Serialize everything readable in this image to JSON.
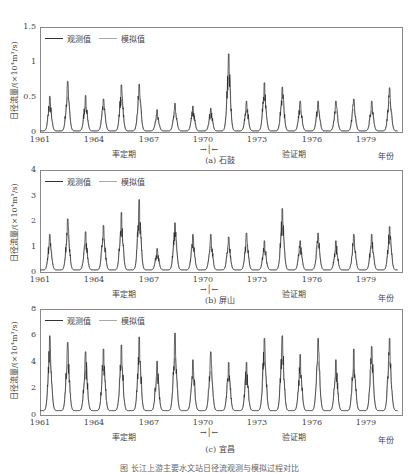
{
  "chart_data": [
    {
      "type": "line",
      "panel": "(a) 石鼓",
      "ylabel": "日径流量/(×10⁴m³/s)",
      "xlabel": "年份",
      "yticks": [
        "0",
        "0.5",
        "1",
        "1.5"
      ],
      "ylim": [
        0,
        1.5
      ],
      "xticks": [
        "1961",
        "1964",
        "1967",
        "1970",
        "1973",
        "1976",
        "1979"
      ],
      "legend": [
        "观测值",
        "模拟值"
      ],
      "annual_peaks_years": [
        1961,
        1962,
        1963,
        1964,
        1965,
        1966,
        1967,
        1968,
        1969,
        1970,
        1971,
        1972,
        1973,
        1974,
        1975,
        1976,
        1977,
        1978,
        1979,
        1980
      ],
      "annual_peaks": [
        0.52,
        0.73,
        0.53,
        0.48,
        0.68,
        0.69,
        0.33,
        0.42,
        0.38,
        0.35,
        1.12,
        0.45,
        0.71,
        0.65,
        0.45,
        0.45,
        0.45,
        0.48,
        0.45,
        0.64
      ],
      "calibration_label": "率定期",
      "validation_label": "验证期"
    },
    {
      "type": "line",
      "panel": "(b) 屏山",
      "ylabel": "日径流量/(×10⁴m³/s)",
      "xlabel": "年份",
      "yticks": [
        "0",
        "1",
        "2",
        "3",
        "4"
      ],
      "ylim": [
        0,
        4
      ],
      "xticks": [
        "1961",
        "1964",
        "1967",
        "1970",
        "1973",
        "1976",
        "1979"
      ],
      "legend": [
        "观测值",
        "模拟值"
      ],
      "annual_peaks_years": [
        1961,
        1962,
        1963,
        1964,
        1965,
        1966,
        1967,
        1968,
        1969,
        1970,
        1971,
        1972,
        1973,
        1974,
        1975,
        1976,
        1977,
        1978,
        1979,
        1980
      ],
      "annual_peaks": [
        1.5,
        2.1,
        1.6,
        1.85,
        2.35,
        2.85,
        0.95,
        1.95,
        1.5,
        1.5,
        1.4,
        1.55,
        1.25,
        2.5,
        1.25,
        1.55,
        1.25,
        1.5,
        1.5,
        1.8
      ],
      "calibration_label": "率定期",
      "validation_label": "验证期"
    },
    {
      "type": "line",
      "panel": "(c) 宜昌",
      "ylabel": "日径流量/(×10⁴m³/s)",
      "xlabel": "年份",
      "yticks": [
        "0",
        "2",
        "4",
        "6",
        "8"
      ],
      "ylim": [
        0,
        8
      ],
      "xticks": [
        "1961",
        "1964",
        "1967",
        "1970",
        "1973",
        "1976",
        "1979"
      ],
      "legend": [
        "观测值",
        "模拟值"
      ],
      "annual_peaks_years": [
        1961,
        1962,
        1963,
        1964,
        1965,
        1966,
        1967,
        1968,
        1969,
        1970,
        1971,
        1972,
        1973,
        1974,
        1975,
        1976,
        1977,
        1978,
        1979,
        1980
      ],
      "annual_peaks": [
        6.0,
        5.5,
        4.8,
        5.0,
        5.3,
        5.9,
        4.1,
        6.2,
        4.2,
        4.8,
        4.0,
        4.0,
        5.8,
        6.0,
        4.6,
        5.8,
        4.2,
        5.0,
        5.2,
        5.8
      ],
      "calibration_label": "率定期",
      "validation_label": "验证期"
    }
  ],
  "panels": [
    {
      "title": "(a) 石鼓",
      "yticks": [
        "1.5",
        "1",
        "0.5",
        "0"
      ],
      "max": 1.5,
      "peaks": [
        0.52,
        0.73,
        0.53,
        0.48,
        0.68,
        0.69,
        0.33,
        0.42,
        0.38,
        0.35,
        1.12,
        0.45,
        0.71,
        0.65,
        0.45,
        0.45,
        0.45,
        0.48,
        0.45,
        0.64
      ],
      "base": 0.03
    },
    {
      "title": "(b) 屏山",
      "yticks": [
        "4",
        "3",
        "2",
        "1",
        "0"
      ],
      "max": 4,
      "peaks": [
        1.5,
        2.1,
        1.6,
        1.85,
        2.35,
        2.85,
        0.95,
        1.95,
        1.5,
        1.5,
        1.4,
        1.55,
        1.25,
        2.5,
        1.25,
        1.55,
        1.25,
        1.5,
        1.5,
        1.8
      ],
      "base": 0.12
    },
    {
      "title": "(c) 宜昌",
      "yticks": [
        "8",
        "6",
        "4",
        "2",
        "0"
      ],
      "max": 8,
      "peaks": [
        6.0,
        5.5,
        4.8,
        5.0,
        5.3,
        5.9,
        4.1,
        6.2,
        4.2,
        4.8,
        4.0,
        4.0,
        5.8,
        6.0,
        4.6,
        5.8,
        4.2,
        5.0,
        5.2,
        5.8
      ],
      "base": 0.4
    }
  ],
  "common": {
    "ylabel": "日径流量/(×10⁴m³/s)",
    "legend_obs": "观测值",
    "legend_sim": "模拟值",
    "xticks": [
      "1961",
      "1964",
      "1967",
      "1970",
      "1973",
      "1976",
      "1979"
    ],
    "calibration": "率定期",
    "validation": "验证期",
    "year_label": "年份",
    "arrow_left": "→|",
    "arrow_right": "←"
  },
  "caption": "图 长江上游主要水文站日径流观测与模拟过程对比"
}
